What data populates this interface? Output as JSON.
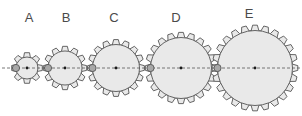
{
  "figure": {
    "background_color": "#ffffff",
    "width": 302,
    "height": 116
  },
  "style": {
    "gear_fill": "#e9e9e9",
    "gear_stroke": "#555555",
    "gear_stroke_width": 0.9,
    "hub_fill": "#a8a8a8",
    "hub_stroke": "#555555",
    "center_dot_fill": "#1a1a1a",
    "centerline_color": "#555555",
    "centerline_dash": "3,2",
    "label_color": "#4a4a4a",
    "label_font_size": 13
  },
  "axis": {
    "centerline_y": 68,
    "centerline_x_start": 2,
    "centerline_x_end": 300
  },
  "chart_data": {
    "type": "diagram",
    "gears": [
      {
        "label": "A",
        "teeth": 8,
        "cx": 27,
        "cy": 68,
        "body_radius": 11,
        "tooth_height": 4.5,
        "tooth_width_deg": 18,
        "hub_radius": 3.6,
        "hub_cx": 16,
        "center_dot_radius": 1.4,
        "label_x": 29,
        "label_y": 22
      },
      {
        "label": "B",
        "teeth": 12,
        "cx": 65,
        "cy": 68,
        "body_radius": 17,
        "tooth_height": 4.8,
        "tooth_width_deg": 12,
        "hub_radius": 3.6,
        "hub_cx": 48,
        "center_dot_radius": 1.4,
        "label_x": 66,
        "label_y": 22
      },
      {
        "label": "C",
        "teeth": 16,
        "cx": 116,
        "cy": 68,
        "body_radius": 23.5,
        "tooth_height": 5.0,
        "tooth_width_deg": 9,
        "hub_radius": 3.6,
        "hub_cx": 92.5,
        "center_dot_radius": 1.4,
        "label_x": 114,
        "label_y": 22
      },
      {
        "label": "D",
        "teeth": 20,
        "cx": 181,
        "cy": 68,
        "body_radius": 30.5,
        "tooth_height": 5.2,
        "tooth_width_deg": 7.2,
        "hub_radius": 3.6,
        "hub_cx": 150.5,
        "center_dot_radius": 1.4,
        "label_x": 176,
        "label_y": 22
      },
      {
        "label": "E",
        "teeth": 24,
        "cx": 255,
        "cy": 68,
        "body_radius": 37.5,
        "tooth_height": 5.4,
        "tooth_width_deg": 6,
        "hub_radius": 3.6,
        "hub_cx": 217.5,
        "center_dot_radius": 1.4,
        "label_x": 249,
        "label_y": 18
      }
    ],
    "labels": [
      "A",
      "B",
      "C",
      "D",
      "E"
    ],
    "tooth_counts": [
      8,
      12,
      16,
      20,
      24
    ]
  }
}
